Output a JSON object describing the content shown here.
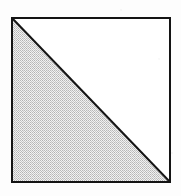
{
  "figure": {
    "title": "Square with shaded lower-left triangle",
    "description": "A square outlined in black with a diagonal drawn from the top-left corner to the bottom-right corner; the lower-left triangular half is filled with a gray halftone dither pattern and the upper-right half is left white.",
    "canvas": {
      "width": 181,
      "height": 196
    },
    "background_color": "#fdfdfd",
    "square": {
      "name": "square",
      "x": 11,
      "y": 17,
      "width": 160,
      "height": 166,
      "stroke_color": "#141414",
      "stroke_width": 2,
      "fill_color": "#ffffff",
      "corners": {
        "top_left": [
          11,
          17
        ],
        "top_right": [
          171,
          17
        ],
        "bottom_right": [
          171,
          183
        ],
        "bottom_left": [
          11,
          183
        ]
      }
    },
    "diagonal": {
      "name": "diagonal",
      "from": [
        11,
        17
      ],
      "to": [
        171,
        183
      ],
      "stroke_color": "#141414",
      "stroke_width": 2
    },
    "shaded_triangle": {
      "name": "shaded-lower-left-triangle",
      "vertices": [
        [
          11,
          17
        ],
        [
          11,
          183
        ],
        [
          171,
          183
        ]
      ],
      "fill_style": "halftone-dither",
      "fill_color": "#d9d9d9",
      "dither_dark": "#b4b4b4",
      "dither_light": "#f2f2f2",
      "area_fraction": "1/2"
    },
    "unshaded_triangle": {
      "name": "unshaded-upper-right-triangle",
      "vertices": [
        [
          11,
          17
        ],
        [
          171,
          17
        ],
        [
          171,
          183
        ]
      ],
      "fill_style": "solid",
      "fill_color": "#ffffff",
      "area_fraction": "1/2"
    }
  }
}
